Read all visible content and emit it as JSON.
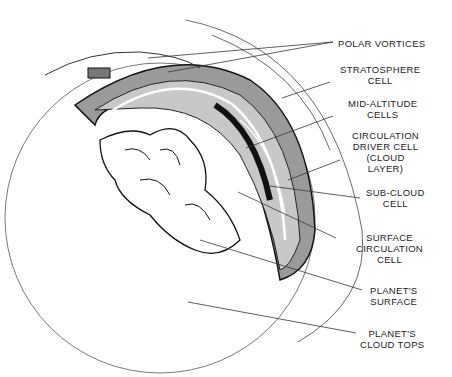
{
  "diagram": {
    "type": "cutaway atmosphere cross-section",
    "labels": [
      {
        "id": "polar-vortices",
        "text": "POLAR VORTICES",
        "x": 338,
        "y": 38
      },
      {
        "id": "stratosphere-cell",
        "text": "STRATOSPHERE\nCELL",
        "x": 345,
        "y": 64
      },
      {
        "id": "mid-altitude-cells",
        "text": "MID-ALTITUDE\nCELLS",
        "x": 349,
        "y": 98
      },
      {
        "id": "circulation-driver-cell",
        "text": "CIRCULATION\nDRIVER CELL\n(CLOUD\nLAYER)",
        "x": 355,
        "y": 130
      },
      {
        "id": "sub-cloud-cell",
        "text": "SUB-CLOUD\nCELL",
        "x": 368,
        "y": 187
      },
      {
        "id": "surface-circulation-cell",
        "text": "SURFACE\nCIRCULATION\nCELL",
        "x": 356,
        "y": 232
      },
      {
        "id": "planets-surface",
        "text": "PLANET'S\nSURFACE",
        "x": 370,
        "y": 285
      },
      {
        "id": "planets-cloud-tops",
        "text": "PLANET'S\nCLOUD TOPS",
        "x": 360,
        "y": 328
      }
    ]
  }
}
